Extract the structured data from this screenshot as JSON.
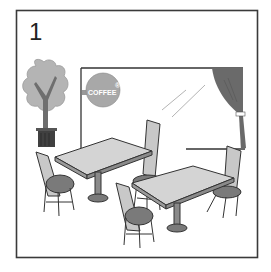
{
  "panel": {
    "number": "1",
    "scene": "cafe interior with two tables and four chairs"
  },
  "sign": {
    "text": "COFFEE",
    "mark": "®"
  },
  "colors": {
    "border": "#3a3a3a",
    "foliage": "#b4b4b4",
    "trunk": "#6e6e6e",
    "pot": "#404040",
    "curtain": "#6a6a6a",
    "table_top": "#d4d4d4",
    "seat": "#7a7a7a",
    "chair_back": "#c8c8c8",
    "line": "#333333"
  }
}
